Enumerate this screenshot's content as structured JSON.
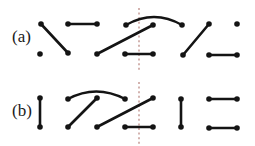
{
  "figure": {
    "width": 255,
    "height": 146,
    "background_color": "#ffffff",
    "vertex_color": "#141414",
    "edge_color": "#141414",
    "divider_color": "#b0766e",
    "vertex_radius": 2.8,
    "edge_width": 2.6,
    "rows": [
      {
        "id": "row-a",
        "label": "(a)",
        "label_x": 12,
        "label_y": 38,
        "divider": {
          "x": 139,
          "y1": 8,
          "y2": 72
        },
        "vertices": [
          {
            "id": "a-t1",
            "x": 41,
            "y": 24
          },
          {
            "id": "a-b1",
            "x": 40,
            "y": 54
          },
          {
            "id": "a-b2",
            "x": 68,
            "y": 53
          },
          {
            "id": "a-t2",
            "x": 68,
            "y": 24
          },
          {
            "id": "a-t3",
            "x": 97,
            "y": 24
          },
          {
            "id": "a-b3",
            "x": 97,
            "y": 54
          },
          {
            "id": "a-t4",
            "x": 126,
            "y": 25
          },
          {
            "id": "a-b4",
            "x": 125,
            "y": 54
          },
          {
            "id": "a-t5",
            "x": 153,
            "y": 25
          },
          {
            "id": "a-b5",
            "x": 153,
            "y": 54
          },
          {
            "id": "a-t6",
            "x": 182,
            "y": 25
          },
          {
            "id": "a-b6",
            "x": 183,
            "y": 55
          },
          {
            "id": "a-t7",
            "x": 209,
            "y": 24
          },
          {
            "id": "a-b7",
            "x": 209,
            "y": 55
          },
          {
            "id": "a-t8",
            "x": 237,
            "y": 24
          },
          {
            "id": "a-b8",
            "x": 237,
            "y": 55
          }
        ],
        "straight_edges": [
          {
            "id": "a-e1",
            "from": "a-t1",
            "to": "a-b2",
            "x1": 41,
            "y1": 24,
            "x2": 68,
            "y2": 53
          },
          {
            "id": "a-e2",
            "from": "a-t2",
            "to": "a-t3",
            "x1": 68,
            "y1": 24,
            "x2": 97,
            "y2": 24
          },
          {
            "id": "a-e3",
            "from": "a-b3",
            "to": "a-t5",
            "x1": 97,
            "y1": 54,
            "x2": 153,
            "y2": 25
          },
          {
            "id": "a-e4",
            "from": "a-b4",
            "to": "a-b5",
            "x1": 125,
            "y1": 54,
            "x2": 153,
            "y2": 54
          },
          {
            "id": "a-e5",
            "from": "a-b6",
            "to": "a-t7",
            "x1": 183,
            "y1": 55,
            "x2": 209,
            "y2": 24
          },
          {
            "id": "a-e6",
            "from": "a-b7",
            "to": "a-b8",
            "x1": 209,
            "y1": 55,
            "x2": 237,
            "y2": 55
          }
        ],
        "arc_edges": [
          {
            "id": "a-arc1",
            "from": "a-t4",
            "to": "a-t6",
            "x1": 126,
            "y1": 25,
            "cx": 154,
            "cy": 9,
            "x2": 182,
            "y2": 25
          }
        ],
        "isolated_vertices": [
          "a-b1",
          "a-t8"
        ]
      },
      {
        "id": "row-b",
        "label": "(b)",
        "label_x": 12,
        "label_y": 112,
        "divider": {
          "x": 139,
          "y1": 82,
          "y2": 146
        },
        "vertices": [
          {
            "id": "b-t1",
            "x": 40,
            "y": 98
          },
          {
            "id": "b-b1",
            "x": 40,
            "y": 127
          },
          {
            "id": "b-t2",
            "x": 68,
            "y": 99
          },
          {
            "id": "b-b2",
            "x": 68,
            "y": 127
          },
          {
            "id": "b-t3",
            "x": 97,
            "y": 98
          },
          {
            "id": "b-b3",
            "x": 97,
            "y": 127
          },
          {
            "id": "b-t4",
            "x": 125,
            "y": 99
          },
          {
            "id": "b-b4",
            "x": 125,
            "y": 127
          },
          {
            "id": "b-t5",
            "x": 153,
            "y": 98
          },
          {
            "id": "b-b5",
            "x": 153,
            "y": 127
          },
          {
            "id": "b-t6",
            "x": 181,
            "y": 99
          },
          {
            "id": "b-b6",
            "x": 181,
            "y": 127
          },
          {
            "id": "b-t7",
            "x": 209,
            "y": 99
          },
          {
            "id": "b-b7",
            "x": 209,
            "y": 128
          },
          {
            "id": "b-t8",
            "x": 237,
            "y": 99
          },
          {
            "id": "b-b8",
            "x": 237,
            "y": 128
          }
        ],
        "straight_edges": [
          {
            "id": "b-e1",
            "from": "b-t1",
            "to": "b-b1",
            "x1": 40,
            "y1": 98,
            "x2": 40,
            "y2": 127
          },
          {
            "id": "b-e2",
            "from": "b-b2",
            "to": "b-t3",
            "x1": 68,
            "y1": 127,
            "x2": 97,
            "y2": 98
          },
          {
            "id": "b-e3",
            "from": "b-b3",
            "to": "b-t5",
            "x1": 97,
            "y1": 127,
            "x2": 153,
            "y2": 98
          },
          {
            "id": "b-e4",
            "from": "b-b4",
            "to": "b-b5",
            "x1": 125,
            "y1": 127,
            "x2": 153,
            "y2": 127
          },
          {
            "id": "b-e5",
            "from": "b-t6",
            "to": "b-b6",
            "x1": 181,
            "y1": 99,
            "x2": 181,
            "y2": 127
          },
          {
            "id": "b-e6",
            "from": "b-t7",
            "to": "b-t8",
            "x1": 209,
            "y1": 99,
            "x2": 237,
            "y2": 99
          },
          {
            "id": "b-e7",
            "from": "b-b7",
            "to": "b-b8",
            "x1": 209,
            "y1": 128,
            "x2": 237,
            "y2": 128
          }
        ],
        "arc_edges": [
          {
            "id": "b-arc1",
            "from": "b-t2",
            "to": "b-t4",
            "x1": 68,
            "y1": 99,
            "cx": 96,
            "cy": 84,
            "x2": 125,
            "y2": 99
          }
        ],
        "isolated_vertices": []
      }
    ]
  }
}
